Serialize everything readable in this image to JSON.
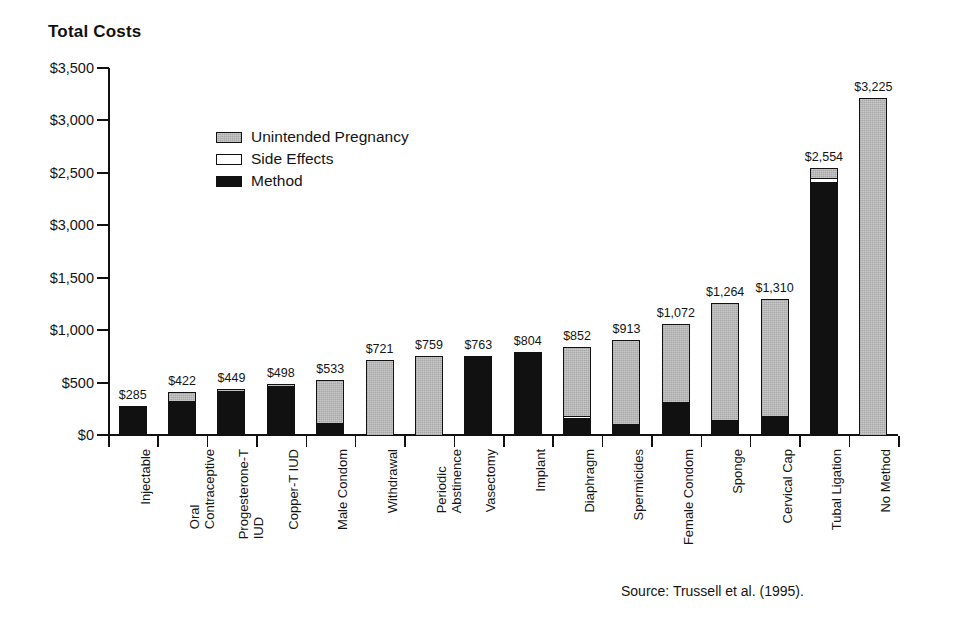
{
  "chart": {
    "title": "Total Costs",
    "source": "Source: Trussell et al. (1995)."
  },
  "legend": {
    "position": "inside-top-left",
    "items": [
      {
        "key": "preg",
        "label": "Unintended Pregnancy",
        "color": "#a8a8a8"
      },
      {
        "key": "side",
        "label": "Side Effects",
        "color": "#ffffff"
      },
      {
        "key": "method",
        "label": "Method",
        "color": "#111111"
      }
    ]
  },
  "yaxis": {
    "labels": [
      "$3,500",
      "$3,000",
      "$2,500",
      "$3,000",
      "$1,500",
      "$1,000",
      "$500",
      "$0"
    ],
    "values": [
      3500,
      3000,
      2500,
      2000,
      1500,
      1000,
      500,
      0
    ],
    "min": 0,
    "max": 3500,
    "step": 500
  },
  "chart_data": {
    "type": "bar",
    "stacked": true,
    "title": "Total Costs",
    "xlabel": "",
    "ylabel": "Total Costs",
    "ylim": [
      0,
      3500
    ],
    "grid": false,
    "legend_position": "inside-top-left",
    "categories": [
      "Injectable",
      "Oral Contraceptive",
      "Progesterone-T IUD",
      "Copper-T IUD",
      "Male Condom",
      "Withdrawal",
      "Periodic Abstinence",
      "Vasectomy",
      "Implant",
      "Diaphragm",
      "Spermicides",
      "Female Condom",
      "Sponge",
      "Cervical Cap",
      "Tubal Ligation",
      "No Method"
    ],
    "category_lines": [
      [
        "Injectable"
      ],
      [
        "Oral",
        "Contraceptive"
      ],
      [
        "Progesterone-T",
        "IUD"
      ],
      [
        "Copper-T IUD"
      ],
      [
        "Male Condom"
      ],
      [
        "Withdrawal"
      ],
      [
        "Periodic",
        "Abstinence"
      ],
      [
        "Vasectomy"
      ],
      [
        "Implant"
      ],
      [
        "Diaphragm"
      ],
      [
        "Spermicides"
      ],
      [
        "Female Condom"
      ],
      [
        "Sponge"
      ],
      [
        "Cervical Cap"
      ],
      [
        "Tubal Ligation"
      ],
      [
        "No Method"
      ]
    ],
    "series": [
      {
        "name": "Method",
        "values": [
          285,
          330,
          432,
          478,
          120,
          0,
          0,
          763,
          804,
          165,
          100,
          320,
          130,
          170,
          2410,
          0
        ]
      },
      {
        "name": "Side Effects",
        "values": [
          0,
          0,
          0,
          0,
          0,
          0,
          0,
          0,
          0,
          22,
          18,
          0,
          22,
          25,
          55,
          0
        ]
      },
      {
        "name": "Unintended Pregnancy",
        "values": [
          0,
          92,
          17,
          20,
          413,
          721,
          759,
          0,
          0,
          665,
          795,
          752,
          1112,
          1115,
          89,
          3225
        ]
      }
    ],
    "totals": [
      285,
      422,
      449,
      498,
      533,
      721,
      759,
      763,
      804,
      852,
      913,
      1072,
      1264,
      1310,
      2554,
      3225
    ],
    "total_labels": [
      "$285",
      "$422",
      "$449",
      "$498",
      "$533",
      "$721",
      "$759",
      "$763",
      "$804",
      "$852",
      "$913",
      "$1,072",
      "$1,264",
      "$1,310",
      "$2,554",
      "$3,225"
    ]
  }
}
